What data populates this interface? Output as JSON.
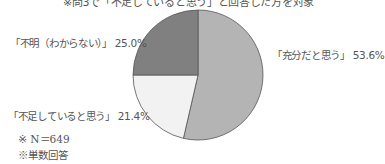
{
  "chart_data": {
    "type": "pie",
    "title": "※問3で「不足していると思う」と回答した方を対象",
    "slices": [
      {
        "label": "「充分だと思う」",
        "value": 53.6,
        "color": "#b4b4b4"
      },
      {
        "label": "「不足していると思う」",
        "value": 21.4,
        "color": "#f2f2f2"
      },
      {
        "label": "「不明（わからない）」",
        "value": 25.0,
        "color": "#808080"
      }
    ],
    "start_angle": "12 o'clock",
    "direction": "clockwise",
    "notes": [
      "※ N＝649",
      "※単数回答"
    ]
  },
  "labels": {
    "sufficient": "「充分だと思う」 53.6%",
    "insufficient": "「不足していると思う」 21.4%",
    "unknown": "「不明（わからない）」 25.0%"
  },
  "notes": {
    "n": "※ N＝649",
    "single": "※単数回答"
  }
}
